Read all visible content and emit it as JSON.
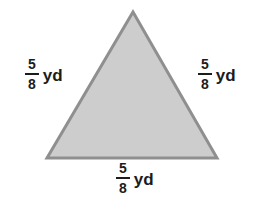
{
  "figure": {
    "type": "geometry-diagram",
    "shape": "equilateral-triangle",
    "colors": {
      "fill": "#cdcdcd",
      "stroke": "#8f8f8f",
      "background": "#ffffff",
      "text": "#1c1c1c"
    },
    "labels": {
      "left": {
        "numerator": "5",
        "denominator": "8",
        "unit": "yd"
      },
      "right": {
        "numerator": "5",
        "denominator": "8",
        "unit": "yd"
      },
      "bottom": {
        "numerator": "5",
        "denominator": "8",
        "unit": "yd"
      }
    }
  }
}
